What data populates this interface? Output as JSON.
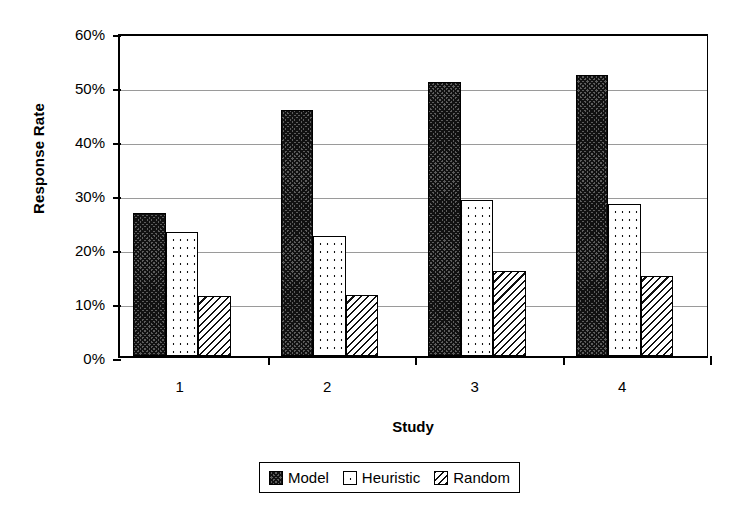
{
  "chart_data": {
    "type": "bar",
    "title": "",
    "xlabel": "Study",
    "ylabel": "Response Rate",
    "categories": [
      "1",
      "2",
      "3",
      "4"
    ],
    "series": [
      {
        "name": "Model",
        "values": [
          26.5,
          45.5,
          50.7,
          52.0
        ]
      },
      {
        "name": "Heuristic",
        "values": [
          23.0,
          22.3,
          28.8,
          28.1
        ]
      },
      {
        "name": "Random",
        "values": [
          11.2,
          11.3,
          15.7,
          14.9
        ]
      }
    ],
    "ylim": [
      0,
      60
    ],
    "yticks": [
      0,
      10,
      20,
      30,
      40,
      50,
      60
    ],
    "ytick_labels": [
      "0%",
      "10%",
      "20%",
      "30%",
      "40%",
      "50%",
      "60%"
    ],
    "value_unit": "percent",
    "grid": "horizontal",
    "legend_position": "bottom",
    "legend_entries": [
      {
        "label": "Model",
        "pattern": "dense-crosshatch-dark"
      },
      {
        "label": "Heuristic",
        "pattern": "white-dotted"
      },
      {
        "label": "Random",
        "pattern": "diagonal-hatch"
      }
    ]
  }
}
